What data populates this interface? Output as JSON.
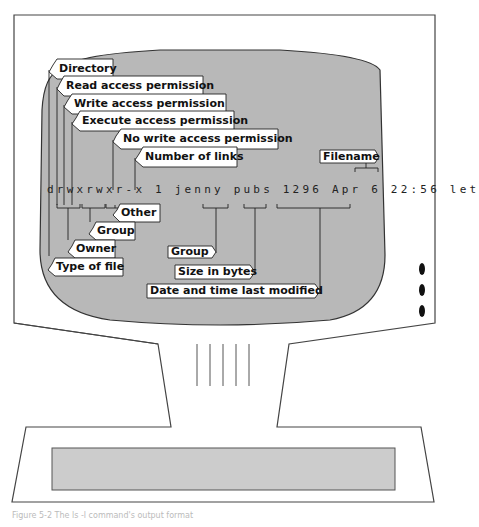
{
  "figure": {
    "caption": "Figure 5-2  The ls -l command's output format"
  },
  "terminal_line": {
    "permissions": "drwxrwxr-x",
    "links": "1",
    "owner": "jenny",
    "group": "pubs",
    "size": "1296",
    "date": "Apr  6 22:56",
    "filename": "let"
  },
  "labels": {
    "directory": "Directory",
    "read": "Read access permission",
    "write": "Write access permission",
    "execute": "Execute access permission",
    "no_write": "No write access permission",
    "links": "Number of links",
    "filename": "Filename",
    "other": "Other",
    "group_perm": "Group",
    "owner": "Owner",
    "type": "Type of file",
    "group": "Group",
    "size": "Size in bytes",
    "date": "Date and time last modified"
  },
  "colors": {
    "screen": "#b8b8b8",
    "outline": "#333333",
    "label_bg": "#ffffff"
  }
}
